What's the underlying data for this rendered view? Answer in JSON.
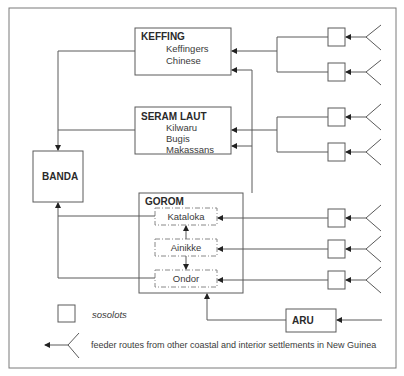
{
  "diagram": {
    "nodes": {
      "keffing": {
        "title": "KEFFING",
        "items": [
          "Keffingers",
          "Chinese"
        ]
      },
      "seram_laut": {
        "title": "SERAM LAUT",
        "items": [
          "Kilwaru",
          "Bugis",
          "Makassans"
        ]
      },
      "banda": {
        "title": "BANDA"
      },
      "gorom": {
        "title": "GOROM",
        "items": [
          "Kataloka",
          "Ainikke",
          "Ondor"
        ]
      },
      "aru": {
        "title": "ARU"
      }
    },
    "legend": {
      "sosolots": "sosolots",
      "feeder": "feeder routes from other coastal and interior settlements in New Guinea"
    },
    "colors": {
      "line": "#5a5a5a",
      "arrow": "#222222",
      "frame": "#7a7a7a"
    }
  }
}
